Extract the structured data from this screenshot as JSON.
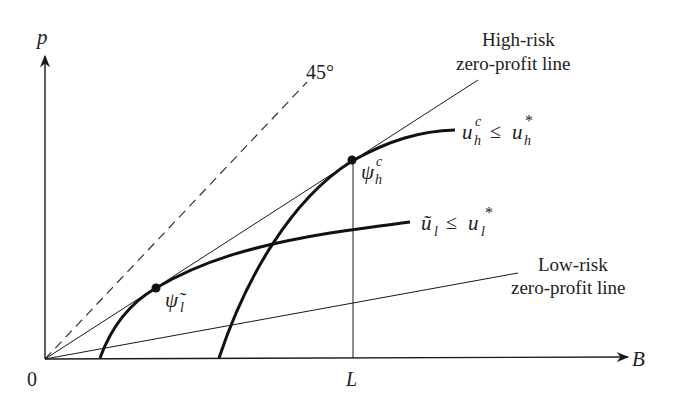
{
  "diagram": {
    "axes": {
      "y_label": "p",
      "x_label": "B",
      "origin_label": "0",
      "x_tick_label": "L"
    },
    "lines": {
      "forty_five": {
        "label": "45°",
        "style": "dashed"
      },
      "high_risk": {
        "label_line1": "High-risk",
        "label_line2": "zero-profit line"
      },
      "low_risk": {
        "label_line1": "Low-risk",
        "label_line2": "zero-profit line"
      }
    },
    "curves": {
      "high_indifference": {
        "base": "u",
        "sub": "h",
        "sup": "c",
        "relation": "≤",
        "rhs_base": "u",
        "rhs_sub": "h",
        "rhs_sup": "*"
      },
      "low_indifference": {
        "base": "ũ",
        "sub": "l",
        "relation": "≤",
        "rhs_base": "u",
        "rhs_sub": "l",
        "rhs_sup": "*"
      }
    },
    "points": {
      "psi_h": {
        "base": "ψ",
        "sub": "h",
        "sup": "c"
      },
      "psi_l": {
        "base": "ψ̃",
        "sub": "l"
      }
    },
    "colors": {
      "ink": "#1a1a1a",
      "background": "#ffffff"
    }
  }
}
